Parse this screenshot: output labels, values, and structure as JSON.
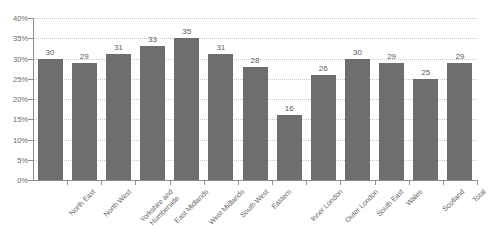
{
  "chart_data": {
    "type": "bar",
    "title": "",
    "xlabel": "",
    "ylabel": "",
    "ylim": [
      0,
      40
    ],
    "y_tick_labels": [
      "40%",
      "35%",
      "30%",
      "25%",
      "20%",
      "15%",
      "10%",
      "5%",
      "0%"
    ],
    "y_tick_values": [
      40,
      35,
      30,
      25,
      20,
      15,
      10,
      5,
      0
    ],
    "grid": true,
    "legend": false,
    "bar_color": "#6e6e6e",
    "gridline_color": "#c9c9c9",
    "axis_color": "#8e8e8e",
    "background_color": "#ffffff",
    "value_suffix": "",
    "categories": [
      "North East",
      "North West",
      "Yorkshire and\nHumberside",
      "East Midlands",
      "West Midlands",
      "South West",
      "Eastern",
      "Inner London",
      "Outer London",
      "South East",
      "Wales",
      "Scotland",
      "Total"
    ],
    "values": [
      30,
      29,
      31,
      33,
      35,
      31,
      28,
      16,
      26,
      30,
      29,
      25,
      29
    ]
  }
}
